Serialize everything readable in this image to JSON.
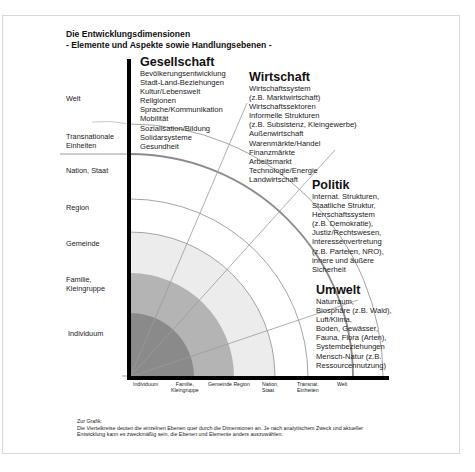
{
  "title": {
    "line1": "Die Entwicklungsdimensionen",
    "line2": "- Elemente und Aspekte sowie Handlungsebenen -"
  },
  "levels_left": [
    {
      "label": "Welt"
    },
    {
      "label": "Transnationale",
      "label2": "Einheiten"
    },
    {
      "label": "Nation, Staat"
    },
    {
      "label": "Region"
    },
    {
      "label": "Gemeinde"
    },
    {
      "label": "Familie,",
      "label2": "Kleingruppe"
    },
    {
      "label": "Individuum"
    }
  ],
  "levels_bottom": [
    {
      "label": "Individuum"
    },
    {
      "label": "Familie,",
      "label2": "Kleingruppe"
    },
    {
      "label": "Gemeinde Region"
    },
    {
      "label": "Nation,",
      "label2": "Staat"
    },
    {
      "label": "Transnat.",
      "label2": "Einheiten"
    },
    {
      "label": "Welt"
    }
  ],
  "dimensions": {
    "gesellschaft": {
      "heading": "Gesellschaft",
      "items": [
        "Bevölkerungsentwicklung",
        "Stadt-Land-Beziehungen",
        "Kultur/Lebenswelt",
        "Religionen",
        "Sprache/Kommunikation",
        "Mobilität",
        "Sozialisation/Bildung",
        "Solidarsysteme",
        "Gesundheit"
      ]
    },
    "wirtschaft": {
      "heading": "Wirtschaft",
      "items": [
        "Wirtschaftssystem",
        "(z.B. Marktwirtschaft)",
        "Wirtschaftssektoren",
        "Informelle Strukturen",
        "(z.B. Subsistenz, Kleingewerbe)",
        "Außenwirtschaft",
        "Warenmärkte/Handel",
        "Finanzmärkte",
        "Arbeitsmarkt",
        "Technologie/Energie",
        "Landwirtschaft"
      ]
    },
    "politik": {
      "heading": "Politik",
      "items": [
        "Internat. Strukturen,",
        "Staatliche Struktur,",
        "Herrschaftssystem",
        "(z.B. Demokratie),",
        "Justiz/Rechtswesen,",
        "Interessenvertretung",
        "(z.B. Parteien, NRO),",
        "innere und äußere",
        "Sicherheit"
      ]
    },
    "umwelt": {
      "heading": "Umwelt",
      "items": [
        "Naturraum,",
        "Biosphäre (z.B. Wald),",
        "Luft/Klima,",
        "Boden, Gewässer,",
        "Fauna, Flora (Arten),",
        "Systembeziehungen",
        "Mensch-Natur (z.B.",
        "Ressourcennutzung)"
      ]
    }
  },
  "note": {
    "heading": "Zur Grafik:",
    "text": "Die Viertelkreise deuten die einzelnen Ebenen quer durch die Dimensionen an. Je nach analytischem Zweck und aktueller Entwicklung kann es zweckmäßig sein, die Ebenen und Elemente anders auszuwählen."
  },
  "colors": {
    "ring_individuum": "#8a8a8a",
    "ring_familie": "#b4b4b4",
    "ring_gemeinde": "#ececec",
    "arc_line": "#9a9a9a",
    "axis": "#000000"
  }
}
